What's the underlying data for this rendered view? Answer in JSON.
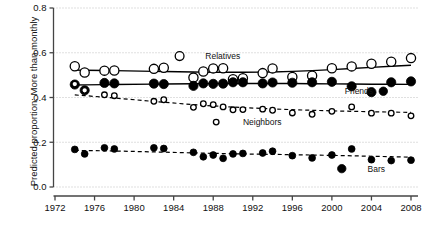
{
  "chart_data": {
    "type": "line",
    "title": "",
    "xlabel": "",
    "ylabel": "Predicted proportion: More than monthly",
    "xlim": [
      1971,
      2009
    ],
    "ylim": [
      0.0,
      0.8
    ],
    "xticks": [
      1972,
      1976,
      1980,
      1984,
      1988,
      1992,
      1996,
      2000,
      2004,
      2008
    ],
    "xticklabels": [
      "1972",
      "1976",
      "1980",
      "1984",
      "1988",
      "1992",
      "1996",
      "2000",
      "2004",
      "2008"
    ],
    "yticks": [
      0.0,
      0.2,
      0.4,
      0.6,
      0.8
    ],
    "yticklabels": [
      "0.0",
      "0.2",
      "0.4",
      "0.6",
      "0.8"
    ],
    "grid": "horizontal-dotted",
    "legend_position": "inline-annotations",
    "series": [
      {
        "name": "Relatives",
        "marker": "open-circle",
        "marker_size": 4.6,
        "linestyle": "solid",
        "label_x": 1987.2,
        "label_y": 0.585,
        "x": [
          1974,
          1975,
          1977,
          1978,
          1982,
          1983,
          1986,
          1987,
          1988,
          1989,
          1990,
          1991,
          1993,
          1994,
          1996,
          1998,
          2000,
          2002,
          2004,
          2006,
          2008
        ],
        "y": [
          0.54,
          0.512,
          0.52,
          0.521,
          0.528,
          0.533,
          0.489,
          0.516,
          0.53,
          0.531,
          0.482,
          0.486,
          0.509,
          0.53,
          0.492,
          0.497,
          0.531,
          0.539,
          0.551,
          0.56,
          0.576
        ]
      },
      {
        "name": "Friends",
        "marker": "filled-circle",
        "marker_size": 4.6,
        "linestyle": "solid",
        "label_x": 2001.3,
        "label_y": 0.428,
        "x": [
          1974,
          1975,
          1977,
          1978,
          1982,
          1983,
          1986,
          1987,
          1988,
          1989,
          1990,
          1991,
          1993,
          1994,
          1996,
          1998,
          2000,
          2002,
          2004,
          2006,
          2008
        ],
        "y": [
          0.458,
          0.432,
          0.465,
          0.463,
          0.462,
          0.46,
          0.452,
          0.463,
          0.461,
          0.462,
          0.468,
          0.468,
          0.463,
          0.467,
          0.466,
          0.468,
          0.47,
          0.45,
          0.424,
          0.468,
          0.472
        ]
      },
      {
        "name": "Neighbors",
        "marker": "small-open-circle",
        "marker_size": 2.8,
        "linestyle": "dashed",
        "label_x": 1991.0,
        "label_y": 0.29,
        "x": [
          1974,
          1975,
          1977,
          1978,
          1982,
          1983,
          1986,
          1987,
          1988,
          1989,
          1990,
          1991,
          1993,
          1994,
          1996,
          1998,
          2000,
          2002,
          2004,
          2006,
          2008
        ],
        "y": [
          0.46,
          0.432,
          0.412,
          0.408,
          0.383,
          0.39,
          0.356,
          0.372,
          0.368,
          0.358,
          0.345,
          0.346,
          0.348,
          0.343,
          0.331,
          0.325,
          0.338,
          0.358,
          0.33,
          0.33,
          0.318
        ]
      },
      {
        "name": "Bars",
        "marker": "filled-circle",
        "marker_size": 3.4,
        "linestyle": "dashed",
        "label_x": 2003.6,
        "label_y": 0.082,
        "x": [
          1974,
          1975,
          1977,
          1978,
          1982,
          1983,
          1986,
          1987,
          1988,
          1989,
          1990,
          1991,
          1993,
          1994,
          1996,
          1998,
          2000,
          2002,
          2004,
          2006,
          2008
        ],
        "y": [
          0.168,
          0.148,
          0.175,
          0.17,
          0.175,
          0.172,
          0.155,
          0.135,
          0.143,
          0.128,
          0.148,
          0.15,
          0.152,
          0.16,
          0.14,
          0.13,
          0.143,
          0.17,
          0.122,
          0.118,
          0.12
        ]
      }
    ],
    "inline_legend_markers": [
      {
        "name": "Relatives",
        "marker": "open-circle",
        "x": 1984.6,
        "y": 0.585
      },
      {
        "name": "Friends",
        "marker": "filled-circle",
        "x": 2005.2,
        "y": 0.428
      },
      {
        "name": "Neighbors",
        "marker": "small-open-circle",
        "x": 1988.3,
        "y": 0.29
      },
      {
        "name": "Bars",
        "marker": "filled-circle",
        "x": 2001.0,
        "y": 0.082
      }
    ]
  }
}
